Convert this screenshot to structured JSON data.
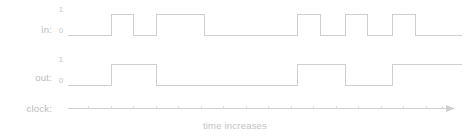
{
  "diagram": {
    "title_caption": "time increases",
    "colors": {
      "wave": "#cfcfcf",
      "tick": "#dcdcdc",
      "text": "#bfbfbf",
      "background": "#ffffff"
    },
    "rows": [
      {
        "key": "in",
        "label": "in:",
        "high_label": "1",
        "low_label": "0"
      },
      {
        "key": "out",
        "label": "out:",
        "high_label": "1",
        "low_label": "0"
      },
      {
        "key": "clock",
        "label": "clock:",
        "high_label": "",
        "low_label": ""
      }
    ]
  },
  "chart_data": {
    "type": "line",
    "title": "",
    "subtitle": "",
    "xlabel": "time increases",
    "ylabel": "",
    "grid": false,
    "legend": "none",
    "axis": {
      "x_start_px": 68,
      "x_end_px": 455,
      "clock_period_px": 22.5,
      "tick_count": 17,
      "arrow": true,
      "ylim": [
        0,
        1
      ],
      "ytick_labels": [
        "0",
        "1"
      ]
    },
    "series": [
      {
        "name": "in",
        "type": "digital",
        "levels": [
          0,
          1
        ],
        "transitions_px": [
          111,
          133,
          156,
          204,
          297,
          320,
          345,
          367,
          392,
          415
        ],
        "samples": [
          {
            "x_px": 68,
            "value": 0
          },
          {
            "x_px": 111,
            "value": 1
          },
          {
            "x_px": 133,
            "value": 0
          },
          {
            "x_px": 156,
            "value": 1
          },
          {
            "x_px": 204,
            "value": 0
          },
          {
            "x_px": 297,
            "value": 1
          },
          {
            "x_px": 320,
            "value": 0
          },
          {
            "x_px": 345,
            "value": 1
          },
          {
            "x_px": 367,
            "value": 0
          },
          {
            "x_px": 392,
            "value": 1
          },
          {
            "x_px": 415,
            "value": 0
          },
          {
            "x_px": 442,
            "value": 0
          }
        ]
      },
      {
        "name": "out",
        "type": "digital",
        "levels": [
          0,
          1
        ],
        "transitions_px": [
          111,
          156,
          297,
          345,
          392
        ],
        "samples": [
          {
            "x_px": 68,
            "value": 0
          },
          {
            "x_px": 111,
            "value": 1
          },
          {
            "x_px": 156,
            "value": 0
          },
          {
            "x_px": 297,
            "value": 1
          },
          {
            "x_px": 345,
            "value": 0
          },
          {
            "x_px": 392,
            "value": 1
          },
          {
            "x_px": 442,
            "value": 1
          }
        ]
      },
      {
        "name": "clock",
        "type": "axis",
        "tick_positions_px": [
          88,
          111,
          133,
          156,
          178,
          201,
          223,
          246,
          268,
          291,
          313,
          336,
          358,
          381,
          403,
          426,
          442
        ]
      }
    ]
  }
}
